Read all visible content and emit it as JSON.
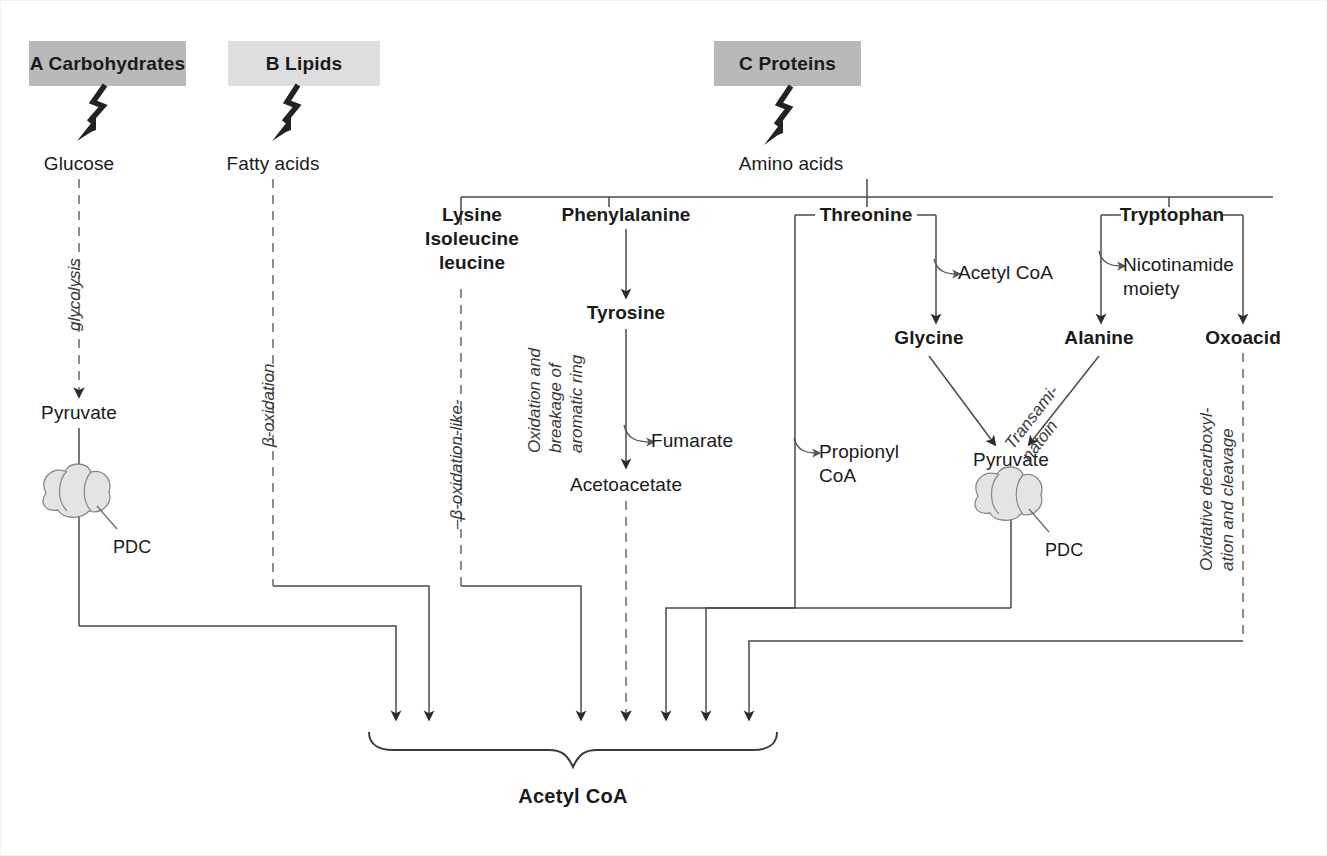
{
  "figure": {
    "colors": {
      "header_dark": "#b9b9b9",
      "header_light": "#dedede",
      "line": "#4a4a4a",
      "dashed_line": "#707070",
      "text": "#1a1a1a",
      "italic_text": "#3a3a3a",
      "enzyme_fill": "#e4e4e4",
      "background": "#ffffff"
    }
  },
  "headers": [
    {
      "id": "A",
      "label": "A Carbohydrates",
      "tone": "dark"
    },
    {
      "id": "B",
      "label": "B Lipids",
      "tone": "light"
    },
    {
      "id": "C",
      "label": "C Proteins",
      "tone": "dark"
    }
  ],
  "nodes": {
    "glucose": "Glucose",
    "fatty_acids": "Fatty acids",
    "amino_acids": "Amino acids",
    "pyruvate_left": "Pyruvate",
    "lysine_group_line1": "Lysine",
    "lysine_group_line2": "Isoleucine",
    "lysine_group_line3": "leucine",
    "phenylalanine": "Phenylalanine",
    "tyrosine": "Tyrosine",
    "acetoacetate": "Acetoacetate",
    "fumarate": "Fumarate",
    "threonine": "Threonine",
    "acetyl_coa_branch": "Acetyl CoA",
    "glycine": "Glycine",
    "propionyl_coa_line1": "Propionyl",
    "propionyl_coa_line2": "CoA",
    "tryptophan": "Tryptophan",
    "nicotinamide_line1": "Nicotinamide",
    "nicotinamide_line2": "moiety",
    "alanine": "Alanine",
    "pyruvate_right": "Pyruvate",
    "oxoacid": "Oxoacid",
    "acetyl_coa_final": "Acetyl CoA"
  },
  "enzymes": [
    {
      "id": "pdc-left",
      "label": "PDC"
    },
    {
      "id": "pdc-right",
      "label": "PDC"
    }
  ],
  "pathway_labels": {
    "glycolysis": "glycolysis",
    "beta_oxidation": "β-oxidation",
    "beta_oxidation_like": "–β-oxidation-like-",
    "aromatic_line1": "Oxidation and",
    "aromatic_line2": "breakage of",
    "aromatic_line3": "aromatic ring",
    "transamination_line1": "Transami-",
    "transamination_line2": "natoin",
    "oxidative_line1": "Oxidative decarboxyl-",
    "oxidative_line2": "ation and cleavage"
  }
}
